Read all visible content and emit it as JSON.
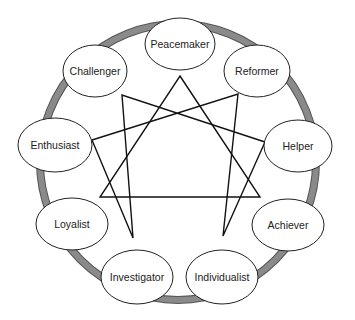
{
  "diagram": {
    "ring": {
      "cx": 178,
      "cy": 162,
      "r": 138,
      "color": "#8a8a8a"
    },
    "nodes": [
      {
        "id": "peacemaker",
        "label": "Peacemaker",
        "cx": 180,
        "cy": 44,
        "rx": 35,
        "ry": 26
      },
      {
        "id": "reformer",
        "label": "Reformer",
        "cx": 257,
        "cy": 71,
        "rx": 33,
        "ry": 26
      },
      {
        "id": "helper",
        "label": "Helper",
        "cx": 298,
        "cy": 146,
        "rx": 34,
        "ry": 26
      },
      {
        "id": "achiever",
        "label": "Achiever",
        "cx": 288,
        "cy": 225,
        "rx": 36,
        "ry": 26
      },
      {
        "id": "individualist",
        "label": "Individualist",
        "cx": 222,
        "cy": 277,
        "rx": 36,
        "ry": 27
      },
      {
        "id": "investigator",
        "label": "Investigator",
        "cx": 137,
        "cy": 277,
        "rx": 36,
        "ry": 27
      },
      {
        "id": "loyalist",
        "label": "Loyalist",
        "cx": 72,
        "cy": 224,
        "rx": 36,
        "ry": 26
      },
      {
        "id": "enthusiast",
        "label": "Enthusiast",
        "cx": 55,
        "cy": 145,
        "rx": 37,
        "ry": 27
      },
      {
        "id": "challenger",
        "label": "Challenger",
        "cx": 95,
        "cy": 71,
        "rx": 32,
        "ry": 26
      }
    ],
    "triangle": [
      [
        180,
        76
      ],
      [
        260,
        197
      ],
      [
        100,
        197
      ]
    ],
    "hexad": [
      [
        238,
        94
      ],
      [
        223,
        236
      ],
      [
        265,
        142
      ],
      [
        122,
        95
      ],
      [
        133,
        238
      ],
      [
        92,
        140
      ]
    ]
  }
}
